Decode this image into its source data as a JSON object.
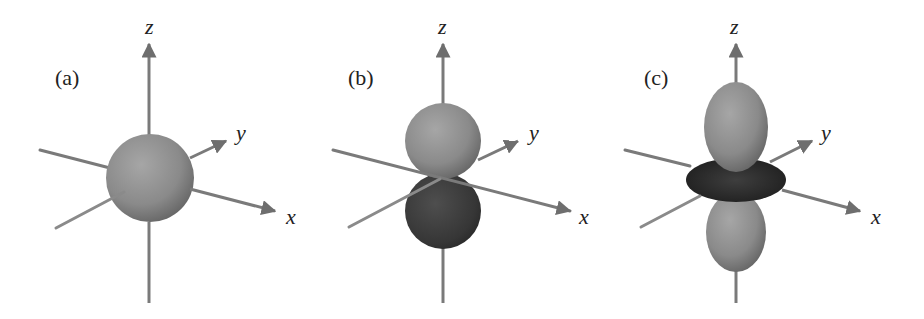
{
  "figure": {
    "panels": [
      {
        "id": "a",
        "label": "(a)",
        "shape": "sphere",
        "axes": {
          "x": "x",
          "y": "y",
          "z": "z"
        }
      },
      {
        "id": "b",
        "label": "(b)",
        "shape": "two-lobes (dumbbell) along z, upper lobe light, lower lobe dark",
        "axes": {
          "x": "x",
          "y": "y",
          "z": "z"
        }
      },
      {
        "id": "c",
        "label": "(c)",
        "shape": "two lobes along z with dark torus ring in xy-plane",
        "axes": {
          "x": "x",
          "y": "y",
          "z": "z"
        }
      }
    ],
    "colors": {
      "axis": "#7a7a7a",
      "lobe_light": "#8a8a8a",
      "lobe_dark": "#3a3a3a",
      "torus": "#2e2e2e",
      "text": "#222222",
      "background": "#ffffff"
    }
  }
}
